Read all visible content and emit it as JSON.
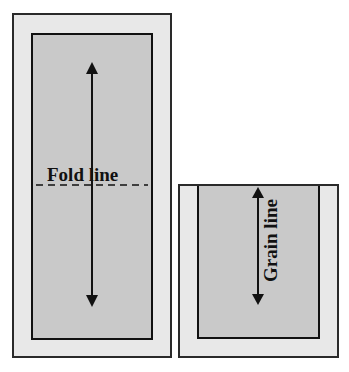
{
  "diagram": {
    "left_piece": {
      "label": "Fold line",
      "fold_line_style": "dashed",
      "arrow": "double-headed vertical"
    },
    "right_piece": {
      "label": "Grain line",
      "label_orientation": "vertical",
      "arrow": "double-headed vertical"
    },
    "colors": {
      "outer_fill": "#e8e8e8",
      "inner_fill": "#c9c9c9",
      "stroke": "#111111",
      "background": "#ffffff"
    }
  }
}
